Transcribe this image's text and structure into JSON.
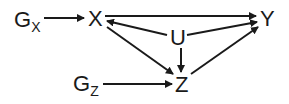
{
  "diagram": {
    "type": "causal-dag",
    "nodes": {
      "gx": {
        "label": "G",
        "subscript": "X"
      },
      "x": {
        "label": "X"
      },
      "y": {
        "label": "Y"
      },
      "u": {
        "label": "U"
      },
      "z": {
        "label": "Z"
      },
      "gz": {
        "label": "G",
        "subscript": "Z"
      }
    },
    "edges": [
      {
        "from": "G_X",
        "to": "X"
      },
      {
        "from": "X",
        "to": "Y"
      },
      {
        "from": "U",
        "to": "X"
      },
      {
        "from": "U",
        "to": "Y"
      },
      {
        "from": "U",
        "to": "Z"
      },
      {
        "from": "X",
        "to": "Z"
      },
      {
        "from": "Z",
        "to": "Y"
      },
      {
        "from": "G_Z",
        "to": "Z"
      }
    ],
    "colors": {
      "ink": "#1a1a1a",
      "background": "#ffffff"
    }
  }
}
